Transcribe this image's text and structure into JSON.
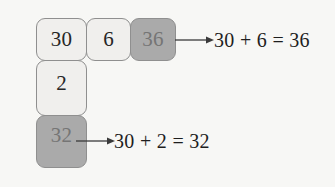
{
  "diagram": {
    "background_color": "#f7f7f5",
    "box_light_fill": "#f0efed",
    "box_dark_fill": "#aaaaaa",
    "box_border_color": "#8f8f8f",
    "light_text_color": "#262626",
    "dark_text_color": "#757575",
    "equation_text_color": "#1e1e1e",
    "top_row": [
      {
        "value": "30",
        "style": "light"
      },
      {
        "value": "6",
        "style": "light"
      },
      {
        "value": "36",
        "style": "dark"
      }
    ],
    "left_column": [
      {
        "value": "2",
        "style": "light"
      },
      {
        "value": "32",
        "style": "dark"
      }
    ],
    "equations": [
      {
        "text": "30 + 6 = 36",
        "source_value": "36"
      },
      {
        "text": "30 + 2 = 32",
        "source_value": "32"
      }
    ],
    "arrows": [
      {
        "name": "arrow-to-top-equation",
        "direction": "right"
      },
      {
        "name": "arrow-to-bottom-equation",
        "direction": "right"
      }
    ]
  }
}
